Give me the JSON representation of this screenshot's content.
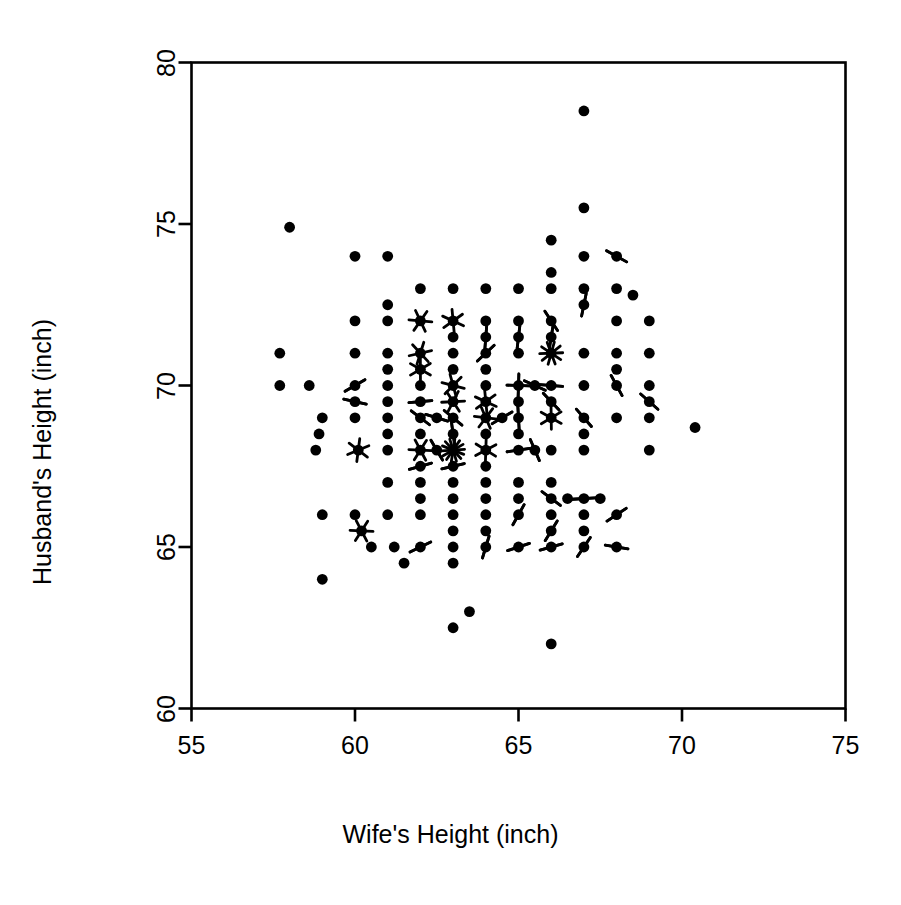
{
  "chart_data": {
    "type": "scatter",
    "title": "",
    "subtitle": "",
    "xlabel": "Wife's Height (inch)",
    "ylabel": "Husband's Height (inch)",
    "xlim": [
      55,
      75
    ],
    "ylim": [
      60,
      80
    ],
    "xticks": [
      55,
      60,
      65,
      70,
      75
    ],
    "yticks": [
      60,
      65,
      70,
      75,
      80
    ],
    "xtick_labels": [
      "55",
      "60",
      "65",
      "70",
      "75"
    ],
    "ytick_labels": [
      "60",
      "65",
      "70",
      "75",
      "80"
    ],
    "grid": false,
    "legend": null,
    "legend_position": "none",
    "marker_style": "sunflower",
    "marker_color": "#000000",
    "axis_color": "#000000",
    "background_color": "#ffffff",
    "points": [
      {
        "x": 58.0,
        "y": 74.9,
        "n": 1
      },
      {
        "x": 57.7,
        "y": 71.0,
        "n": 1
      },
      {
        "x": 57.7,
        "y": 70.0,
        "n": 1
      },
      {
        "x": 58.6,
        "y": 70.0,
        "n": 1
      },
      {
        "x": 59.0,
        "y": 69.0,
        "n": 1
      },
      {
        "x": 58.8,
        "y": 68.0,
        "n": 1
      },
      {
        "x": 58.9,
        "y": 68.5,
        "n": 1
      },
      {
        "x": 59.0,
        "y": 66.0,
        "n": 1
      },
      {
        "x": 59.0,
        "y": 64.0,
        "n": 1
      },
      {
        "x": 60.0,
        "y": 74.0,
        "n": 1
      },
      {
        "x": 60.0,
        "y": 72.0,
        "n": 1
      },
      {
        "x": 60.0,
        "y": 71.0,
        "n": 1
      },
      {
        "x": 60.0,
        "y": 70.0,
        "n": 2
      },
      {
        "x": 60.0,
        "y": 69.5,
        "n": 2
      },
      {
        "x": 60.0,
        "y": 69.0,
        "n": 1
      },
      {
        "x": 60.1,
        "y": 68.0,
        "n": 3
      },
      {
        "x": 60.0,
        "y": 66.0,
        "n": 1
      },
      {
        "x": 60.2,
        "y": 65.5,
        "n": 3
      },
      {
        "x": 60.5,
        "y": 65.0,
        "n": 1
      },
      {
        "x": 61.0,
        "y": 74.0,
        "n": 1
      },
      {
        "x": 61.0,
        "y": 72.5,
        "n": 1
      },
      {
        "x": 61.0,
        "y": 72.0,
        "n": 1
      },
      {
        "x": 61.0,
        "y": 71.0,
        "n": 1
      },
      {
        "x": 61.0,
        "y": 70.5,
        "n": 1
      },
      {
        "x": 61.0,
        "y": 70.0,
        "n": 1
      },
      {
        "x": 61.0,
        "y": 69.5,
        "n": 1
      },
      {
        "x": 61.0,
        "y": 69.0,
        "n": 1
      },
      {
        "x": 61.0,
        "y": 68.5,
        "n": 1
      },
      {
        "x": 61.0,
        "y": 68.0,
        "n": 1
      },
      {
        "x": 61.0,
        "y": 67.0,
        "n": 1
      },
      {
        "x": 61.0,
        "y": 66.0,
        "n": 1
      },
      {
        "x": 61.2,
        "y": 65.0,
        "n": 1
      },
      {
        "x": 61.5,
        "y": 64.5,
        "n": 1
      },
      {
        "x": 62.0,
        "y": 73.0,
        "n": 1
      },
      {
        "x": 62.0,
        "y": 72.0,
        "n": 3
      },
      {
        "x": 62.0,
        "y": 71.0,
        "n": 3
      },
      {
        "x": 62.0,
        "y": 70.5,
        "n": 3
      },
      {
        "x": 62.0,
        "y": 70.0,
        "n": 1
      },
      {
        "x": 62.0,
        "y": 69.5,
        "n": 2
      },
      {
        "x": 62.0,
        "y": 69.0,
        "n": 2
      },
      {
        "x": 62.0,
        "y": 68.5,
        "n": 1
      },
      {
        "x": 62.0,
        "y": 68.0,
        "n": 3
      },
      {
        "x": 62.0,
        "y": 67.5,
        "n": 2
      },
      {
        "x": 62.0,
        "y": 67.0,
        "n": 1
      },
      {
        "x": 62.0,
        "y": 66.5,
        "n": 1
      },
      {
        "x": 62.0,
        "y": 66.0,
        "n": 1
      },
      {
        "x": 62.0,
        "y": 65.0,
        "n": 2
      },
      {
        "x": 62.5,
        "y": 69.0,
        "n": 2
      },
      {
        "x": 62.5,
        "y": 68.0,
        "n": 2
      },
      {
        "x": 63.0,
        "y": 73.0,
        "n": 1
      },
      {
        "x": 63.0,
        "y": 72.0,
        "n": 3
      },
      {
        "x": 63.0,
        "y": 71.5,
        "n": 1
      },
      {
        "x": 63.0,
        "y": 71.0,
        "n": 1
      },
      {
        "x": 63.0,
        "y": 70.5,
        "n": 1
      },
      {
        "x": 63.0,
        "y": 70.0,
        "n": 3
      },
      {
        "x": 63.0,
        "y": 69.5,
        "n": 3
      },
      {
        "x": 63.0,
        "y": 69.0,
        "n": 2
      },
      {
        "x": 63.0,
        "y": 68.5,
        "n": 2
      },
      {
        "x": 63.0,
        "y": 68.0,
        "n": 7
      },
      {
        "x": 63.0,
        "y": 67.5,
        "n": 2
      },
      {
        "x": 63.0,
        "y": 67.0,
        "n": 1
      },
      {
        "x": 63.0,
        "y": 66.5,
        "n": 1
      },
      {
        "x": 63.0,
        "y": 66.0,
        "n": 1
      },
      {
        "x": 63.0,
        "y": 65.5,
        "n": 1
      },
      {
        "x": 63.0,
        "y": 65.0,
        "n": 1
      },
      {
        "x": 63.0,
        "y": 64.5,
        "n": 1
      },
      {
        "x": 63.0,
        "y": 62.5,
        "n": 1
      },
      {
        "x": 63.5,
        "y": 63.0,
        "n": 1
      },
      {
        "x": 64.0,
        "y": 73.0,
        "n": 1
      },
      {
        "x": 64.0,
        "y": 72.0,
        "n": 1
      },
      {
        "x": 64.0,
        "y": 71.5,
        "n": 2
      },
      {
        "x": 64.0,
        "y": 71.0,
        "n": 2
      },
      {
        "x": 64.0,
        "y": 70.5,
        "n": 1
      },
      {
        "x": 64.0,
        "y": 70.0,
        "n": 1
      },
      {
        "x": 64.0,
        "y": 69.5,
        "n": 3
      },
      {
        "x": 64.0,
        "y": 69.0,
        "n": 3
      },
      {
        "x": 64.0,
        "y": 68.5,
        "n": 1
      },
      {
        "x": 64.0,
        "y": 68.0,
        "n": 3
      },
      {
        "x": 64.0,
        "y": 67.5,
        "n": 1
      },
      {
        "x": 64.0,
        "y": 67.0,
        "n": 1
      },
      {
        "x": 64.0,
        "y": 66.5,
        "n": 1
      },
      {
        "x": 64.0,
        "y": 66.0,
        "n": 1
      },
      {
        "x": 64.0,
        "y": 65.5,
        "n": 1
      },
      {
        "x": 64.0,
        "y": 65.0,
        "n": 2
      },
      {
        "x": 64.5,
        "y": 69.0,
        "n": 2
      },
      {
        "x": 65.0,
        "y": 73.0,
        "n": 1
      },
      {
        "x": 65.0,
        "y": 72.0,
        "n": 1
      },
      {
        "x": 65.0,
        "y": 71.5,
        "n": 2
      },
      {
        "x": 65.0,
        "y": 71.0,
        "n": 1
      },
      {
        "x": 65.0,
        "y": 70.0,
        "n": 4
      },
      {
        "x": 65.0,
        "y": 69.5,
        "n": 1
      },
      {
        "x": 65.0,
        "y": 69.0,
        "n": 2
      },
      {
        "x": 65.0,
        "y": 68.5,
        "n": 1
      },
      {
        "x": 65.0,
        "y": 68.0,
        "n": 2
      },
      {
        "x": 65.0,
        "y": 67.0,
        "n": 1
      },
      {
        "x": 65.0,
        "y": 66.5,
        "n": 1
      },
      {
        "x": 65.0,
        "y": 66.0,
        "n": 2
      },
      {
        "x": 65.0,
        "y": 65.0,
        "n": 2
      },
      {
        "x": 65.5,
        "y": 70.0,
        "n": 2
      },
      {
        "x": 65.5,
        "y": 68.0,
        "n": 2
      },
      {
        "x": 66.0,
        "y": 74.5,
        "n": 1
      },
      {
        "x": 66.0,
        "y": 73.5,
        "n": 1
      },
      {
        "x": 66.0,
        "y": 73.0,
        "n": 1
      },
      {
        "x": 66.0,
        "y": 72.0,
        "n": 2
      },
      {
        "x": 66.0,
        "y": 71.5,
        "n": 2
      },
      {
        "x": 66.0,
        "y": 71.0,
        "n": 5
      },
      {
        "x": 66.0,
        "y": 70.0,
        "n": 2
      },
      {
        "x": 66.0,
        "y": 69.5,
        "n": 2
      },
      {
        "x": 66.0,
        "y": 69.0,
        "n": 3
      },
      {
        "x": 66.0,
        "y": 68.0,
        "n": 1
      },
      {
        "x": 66.0,
        "y": 67.0,
        "n": 1
      },
      {
        "x": 66.0,
        "y": 66.5,
        "n": 2
      },
      {
        "x": 66.0,
        "y": 66.0,
        "n": 1
      },
      {
        "x": 66.0,
        "y": 65.5,
        "n": 2
      },
      {
        "x": 66.0,
        "y": 65.0,
        "n": 2
      },
      {
        "x": 66.0,
        "y": 62.0,
        "n": 1
      },
      {
        "x": 66.5,
        "y": 66.5,
        "n": 1
      },
      {
        "x": 67.0,
        "y": 78.5,
        "n": 1
      },
      {
        "x": 67.0,
        "y": 75.5,
        "n": 1
      },
      {
        "x": 67.0,
        "y": 74.0,
        "n": 1
      },
      {
        "x": 67.0,
        "y": 73.0,
        "n": 1
      },
      {
        "x": 67.0,
        "y": 72.5,
        "n": 2
      },
      {
        "x": 67.0,
        "y": 71.0,
        "n": 1
      },
      {
        "x": 67.0,
        "y": 70.0,
        "n": 1
      },
      {
        "x": 67.0,
        "y": 69.0,
        "n": 2
      },
      {
        "x": 67.0,
        "y": 68.5,
        "n": 1
      },
      {
        "x": 67.0,
        "y": 68.0,
        "n": 1
      },
      {
        "x": 67.0,
        "y": 66.5,
        "n": 2
      },
      {
        "x": 67.0,
        "y": 66.0,
        "n": 1
      },
      {
        "x": 67.0,
        "y": 65.5,
        "n": 1
      },
      {
        "x": 67.0,
        "y": 65.0,
        "n": 2
      },
      {
        "x": 67.5,
        "y": 66.5,
        "n": 1
      },
      {
        "x": 68.0,
        "y": 74.0,
        "n": 2
      },
      {
        "x": 68.0,
        "y": 73.0,
        "n": 1
      },
      {
        "x": 68.0,
        "y": 72.0,
        "n": 1
      },
      {
        "x": 68.0,
        "y": 71.0,
        "n": 1
      },
      {
        "x": 68.0,
        "y": 70.5,
        "n": 1
      },
      {
        "x": 68.0,
        "y": 70.0,
        "n": 2
      },
      {
        "x": 68.0,
        "y": 69.0,
        "n": 1
      },
      {
        "x": 68.0,
        "y": 66.0,
        "n": 2
      },
      {
        "x": 68.0,
        "y": 65.0,
        "n": 2
      },
      {
        "x": 68.5,
        "y": 72.8,
        "n": 1
      },
      {
        "x": 69.0,
        "y": 72.0,
        "n": 1
      },
      {
        "x": 69.0,
        "y": 71.0,
        "n": 1
      },
      {
        "x": 69.0,
        "y": 70.0,
        "n": 1
      },
      {
        "x": 69.0,
        "y": 69.5,
        "n": 2
      },
      {
        "x": 69.0,
        "y": 69.0,
        "n": 1
      },
      {
        "x": 69.0,
        "y": 68.0,
        "n": 1
      },
      {
        "x": 70.4,
        "y": 68.7,
        "n": 1
      }
    ]
  },
  "axes": {
    "x_title": "Wife's Height (inch)",
    "y_title": "Husband's Height (inch)"
  }
}
